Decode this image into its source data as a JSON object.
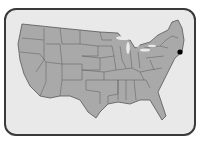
{
  "map": {
    "region": "United States (contiguous)",
    "style": "grayscale",
    "colors": {
      "land": "#a9a9a9",
      "water": "#e9e9e9",
      "border": "#555555",
      "frame": "#3a3a3a",
      "marker": "#000000"
    },
    "marker": {
      "label": "location-marker",
      "x": 180,
      "y": 52
    }
  }
}
